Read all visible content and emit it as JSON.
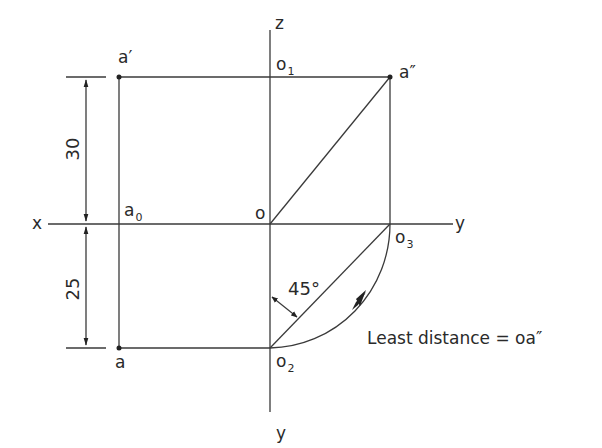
{
  "diagram": {
    "type": "orthographic projection - least distance of point from origin",
    "axes": {
      "x": "x",
      "y_right": "y",
      "y_bottom": "y",
      "z": "z"
    },
    "points": {
      "a_prime": "a′",
      "a_double_prime": "a″",
      "a": "a",
      "a0": "a",
      "a0_sub": "0",
      "o": "o",
      "o1": "o",
      "o1_sub": "1",
      "o2": "o",
      "o2_sub": "2",
      "o3": "o",
      "o3_sub": "3"
    },
    "dimensions": {
      "upper": "30",
      "lower": "25"
    },
    "angle": "45°",
    "annotation": "Least distance = oa″",
    "colors": {
      "line": "#3a3a3a",
      "text": "#2a2a2a",
      "background": "#ffffff"
    }
  }
}
